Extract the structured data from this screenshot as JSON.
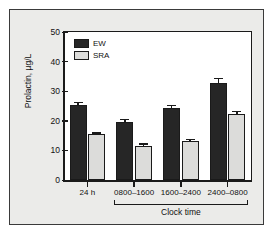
{
  "figure": {
    "background_color": "#ebebe9",
    "plot_background_color": "#ffffff",
    "frame_color": "#3a3a3a"
  },
  "chart_data": {
    "type": "bar",
    "title": "",
    "subtitle": "",
    "xlabel": "Clock time",
    "ylabel": "Prolactin, µg/L",
    "categories": [
      "24 h",
      "0800–1600",
      "1600–2400",
      "2400–0800"
    ],
    "ylim": [
      0,
      50
    ],
    "yticks": [
      0,
      10,
      20,
      30,
      40,
      50
    ],
    "ytick_labels": [
      "0",
      "10",
      "20",
      "30",
      "40",
      "50"
    ],
    "grid": false,
    "legend_position": "top-left",
    "series": [
      {
        "name": "EW",
        "color": "#262626",
        "values": [
          25.4,
          19.6,
          24.4,
          32.7
        ],
        "errors": [
          1.0,
          1.0,
          0.9,
          1.9
        ]
      },
      {
        "name": "SRA",
        "color": "#dcdcda",
        "values": [
          15.5,
          11.5,
          13.1,
          22.3
        ],
        "errors": [
          0.6,
          0.9,
          0.9,
          1.1
        ]
      }
    ],
    "group_bracket_label": "Clock time",
    "group_bracket_categories": [
      "0800–1600",
      "1600–2400",
      "2400–0800"
    ]
  },
  "legend": {
    "items": [
      {
        "label": "EW",
        "color": "#262626"
      },
      {
        "label": "SRA",
        "color": "#dcdcda"
      }
    ]
  }
}
